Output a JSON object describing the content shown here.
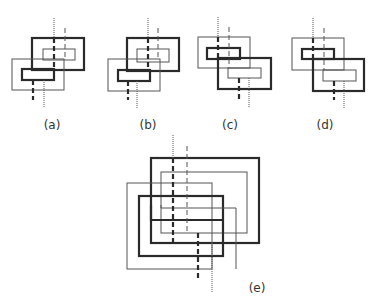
{
  "colors": {
    "thick": "#2a2a2a",
    "thin": "#555555",
    "background": "#ffffff",
    "label": "#333333"
  },
  "figures": [
    {
      "id": "a",
      "label": "(a)",
      "label_pos": [
        52,
        127
      ],
      "rects": [
        {
          "x1": 32,
          "y1": 38,
          "x2": 84,
          "y2": 70,
          "style": "thick"
        },
        {
          "x1": 43,
          "y1": 49,
          "x2": 75,
          "y2": 60,
          "style": "thin"
        },
        {
          "x1": 12,
          "y1": 59,
          "x2": 64,
          "y2": 90,
          "style": "thin"
        },
        {
          "x1": 22,
          "y1": 69,
          "x2": 54,
          "y2": 80,
          "style": "thick"
        }
      ],
      "strands": [
        {
          "x": 54,
          "y1": 18,
          "y2": 38,
          "style": "dotted"
        },
        {
          "x": 54,
          "y1": 38,
          "y2": 69,
          "style": "thick-dashed"
        },
        {
          "x": 65,
          "y1": 28,
          "y2": 59,
          "style": "thin-dashed"
        },
        {
          "x": 33,
          "y1": 80,
          "y2": 100,
          "style": "thick-dashed"
        },
        {
          "x": 44,
          "y1": 80,
          "y2": 108,
          "style": "dotted"
        }
      ]
    },
    {
      "id": "b",
      "label": "(b)",
      "label_pos": [
        148,
        127
      ],
      "rects": [
        {
          "x1": 127,
          "y1": 38,
          "x2": 179,
          "y2": 71,
          "style": "thick"
        },
        {
          "x1": 137,
          "y1": 49,
          "x2": 169,
          "y2": 62,
          "style": "thin"
        },
        {
          "x1": 108,
          "y1": 59,
          "x2": 160,
          "y2": 91,
          "style": "thin"
        },
        {
          "x1": 118,
          "y1": 70,
          "x2": 150,
          "y2": 81,
          "style": "thick"
        }
      ],
      "strands": [
        {
          "x": 148,
          "y1": 18,
          "y2": 38,
          "style": "dotted"
        },
        {
          "x": 148,
          "y1": 38,
          "y2": 70,
          "style": "thick-dashed"
        },
        {
          "x": 158,
          "y1": 28,
          "y2": 59,
          "style": "thin-dashed"
        },
        {
          "x": 128,
          "y1": 81,
          "y2": 100,
          "style": "thick-dashed"
        },
        {
          "x": 137,
          "y1": 81,
          "y2": 108,
          "style": "dotted"
        }
      ]
    },
    {
      "id": "c",
      "label": "(c)",
      "label_pos": [
        230,
        127
      ],
      "rects": [
        {
          "x1": 198,
          "y1": 37,
          "x2": 250,
          "y2": 68,
          "style": "thin"
        },
        {
          "x1": 207,
          "y1": 48,
          "x2": 240,
          "y2": 59,
          "style": "thick"
        },
        {
          "x1": 218,
          "y1": 58,
          "x2": 271,
          "y2": 89,
          "style": "thick"
        },
        {
          "x1": 228,
          "y1": 68,
          "x2": 261,
          "y2": 78,
          "style": "thin"
        }
      ],
      "strands": [
        {
          "x": 218,
          "y1": 17,
          "y2": 37,
          "style": "dotted"
        },
        {
          "x": 218,
          "y1": 37,
          "y2": 58,
          "style": "thick-dashed"
        },
        {
          "x": 229,
          "y1": 27,
          "y2": 68,
          "style": "thin-dashed"
        },
        {
          "x": 239,
          "y1": 78,
          "y2": 100,
          "style": "thick-dashed"
        },
        {
          "x": 249,
          "y1": 78,
          "y2": 108,
          "style": "dotted"
        }
      ]
    },
    {
      "id": "d",
      "label": "(d)",
      "label_pos": [
        325,
        127
      ],
      "rects": [
        {
          "x1": 292,
          "y1": 38,
          "x2": 344,
          "y2": 70,
          "style": "thin"
        },
        {
          "x1": 302,
          "y1": 49,
          "x2": 334,
          "y2": 59,
          "style": "thick"
        },
        {
          "x1": 313,
          "y1": 59,
          "x2": 364,
          "y2": 91,
          "style": "thick"
        },
        {
          "x1": 323,
          "y1": 70,
          "x2": 356,
          "y2": 81,
          "style": "thin"
        }
      ],
      "strands": [
        {
          "x": 313,
          "y1": 18,
          "y2": 38,
          "style": "dotted"
        },
        {
          "x": 313,
          "y1": 38,
          "y2": 59,
          "style": "thick-dashed"
        },
        {
          "x": 324,
          "y1": 28,
          "y2": 70,
          "style": "thin-dashed"
        },
        {
          "x": 334,
          "y1": 81,
          "y2": 100,
          "style": "thick-dashed"
        },
        {
          "x": 344,
          "y1": 81,
          "y2": 108,
          "style": "dotted"
        }
      ]
    },
    {
      "id": "e",
      "label": "(e)",
      "label_pos": [
        257,
        290
      ],
      "rects": [
        {
          "x1": 151,
          "y1": 158,
          "x2": 259,
          "y2": 243,
          "style": "thick"
        },
        {
          "x1": 161,
          "y1": 172,
          "x2": 247,
          "y2": 233,
          "style": "thin"
        },
        {
          "x1": 127,
          "y1": 183,
          "x2": 212,
          "y2": 269,
          "style": "thin"
        },
        {
          "x1": 139,
          "y1": 196,
          "x2": 223,
          "y2": 256,
          "style": "thick"
        }
      ],
      "polylines": [
        {
          "points": [
            [
              151,
              205
            ],
            [
              151,
              220
            ],
            [
              223,
              220
            ]
          ],
          "style": "thick"
        },
        {
          "points": [
            [
              161,
              205
            ],
            [
              161,
              208
            ],
            [
              236,
              208
            ],
            [
              236,
              269
            ]
          ],
          "style": "thin"
        }
      ],
      "strands": [
        {
          "x": 173,
          "y1": 135,
          "y2": 158,
          "style": "dotted"
        },
        {
          "x": 173,
          "y1": 158,
          "y2": 243,
          "style": "thick-dashed"
        },
        {
          "x": 187,
          "y1": 146,
          "y2": 233,
          "style": "thin-dashed"
        },
        {
          "x": 198,
          "y1": 233,
          "y2": 280,
          "style": "thick-dashed"
        },
        {
          "x": 212,
          "y1": 243,
          "y2": 292,
          "style": "dotted"
        }
      ]
    }
  ]
}
